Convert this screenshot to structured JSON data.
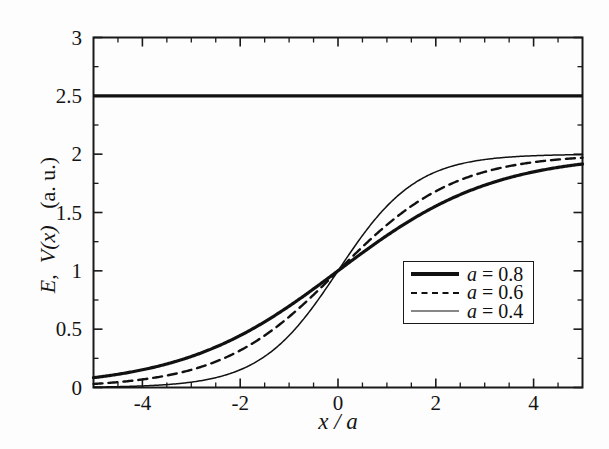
{
  "figure": {
    "background_color": "#fdfdfd",
    "frame_color": "#1a1a1a"
  },
  "axes": {
    "x_title": "x / a",
    "y_title_parts": {
      "e": "E",
      "comma": ",",
      "v": "V(x)",
      "units": "(a. u.)"
    },
    "y_title_full": "E,  V(x)   (a. u.)",
    "x_tick_labels": [
      "-4",
      "-2",
      "0",
      "2",
      "4"
    ],
    "x_tick_values": [
      -4,
      -2,
      0,
      2,
      4
    ],
    "y_tick_labels": [
      "0",
      "0.5",
      "1",
      "1.5",
      "2",
      "2.5",
      "3"
    ],
    "y_tick_values": [
      0,
      0.5,
      1,
      1.5,
      2,
      2.5,
      3
    ],
    "x_minor_values": [
      -5,
      -4.5,
      -3.5,
      -3,
      -2.5,
      -1.5,
      -1,
      -0.5,
      0.5,
      1,
      1.5,
      2.5,
      3,
      3.5,
      4.5,
      5
    ],
    "y_minor_values": [
      0.25,
      0.75,
      1.25,
      1.75,
      2.25,
      2.75
    ]
  },
  "chart_data": {
    "type": "line",
    "title": "",
    "xlabel": "x / a",
    "ylabel": "E, V(x) (a. u.)",
    "xlim": [
      -5,
      5
    ],
    "ylim": [
      0,
      3
    ],
    "grid": false,
    "legend_position": "center-right",
    "annotations": [
      {
        "name": "energy-level",
        "label": "E = 2.5",
        "type": "horizontal-line",
        "y": 2.5,
        "style": "solid",
        "linewidth": 3.2
      }
    ],
    "series": [
      {
        "name": "a = 0.8",
        "style": "solid",
        "linewidth": 3.2,
        "color": "#111111",
        "model": "V(x) = 2 / (1 + exp(-x/(2*0.8)))",
        "steepness": 0.8,
        "x": [
          -5,
          -4.5,
          -4,
          -3.5,
          -3,
          -2.5,
          -2,
          -1.5,
          -1,
          -0.5,
          0,
          0.5,
          1,
          1.5,
          2,
          2.5,
          3,
          3.5,
          4,
          4.5,
          5
        ],
        "y": [
          0.08,
          0.12,
          0.17,
          0.23,
          0.31,
          0.42,
          0.56,
          0.73,
          0.93,
          1.15,
          1.0,
          1.26,
          1.47,
          1.64,
          1.77,
          1.86,
          1.91,
          1.94,
          1.96,
          1.97,
          1.98
        ]
      },
      {
        "name": "a = 0.6",
        "style": "dashed",
        "linewidth": 2.4,
        "color": "#111111",
        "model": "V(x) = 2 / (1 + exp(-x/(2*0.6)))",
        "steepness": 0.6,
        "x": [
          -5,
          -4.5,
          -4,
          -3.5,
          -3,
          -2.5,
          -2,
          -1.5,
          -1,
          -0.5,
          0,
          0.5,
          1,
          1.5,
          2,
          2.5,
          3,
          3.5,
          4,
          4.5,
          5
        ],
        "y": [
          0.03,
          0.05,
          0.07,
          0.11,
          0.16,
          0.24,
          0.35,
          0.5,
          0.71,
          0.97,
          1.0,
          1.29,
          1.56,
          1.76,
          1.88,
          1.94,
          1.97,
          1.99,
          1.99,
          2.0,
          2.0
        ]
      },
      {
        "name": "a = 0.4",
        "style": "solid",
        "linewidth": 1.5,
        "color": "#111111",
        "model": "V(x) = 2 / (1 + exp(-x/(2*0.4)))",
        "steepness": 0.4,
        "x": [
          -5,
          -4.5,
          -4,
          -3.5,
          -3,
          -2.5,
          -2,
          -1.5,
          -1,
          -0.5,
          0,
          0.5,
          1,
          1.5,
          2,
          2.5,
          3,
          3.5,
          4,
          4.5,
          5
        ],
        "y": [
          0.01,
          0.01,
          0.02,
          0.03,
          0.05,
          0.09,
          0.15,
          0.25,
          0.42,
          0.68,
          1.0,
          1.38,
          1.67,
          1.85,
          1.93,
          1.97,
          1.99,
          1.99,
          2.0,
          2.0,
          2.0
        ]
      }
    ]
  },
  "legend": {
    "entries": [
      {
        "label_var": "a",
        "label_rest": " = 0.8",
        "label_full": "a = 0.8",
        "sample": "thick-solid"
      },
      {
        "label_var": "a",
        "label_rest": " = 0.6",
        "label_full": "a = 0.6",
        "sample": "dashed"
      },
      {
        "label_var": "a",
        "label_rest": " = 0.4",
        "label_full": "a = 0.4",
        "sample": "thin-solid"
      }
    ]
  }
}
